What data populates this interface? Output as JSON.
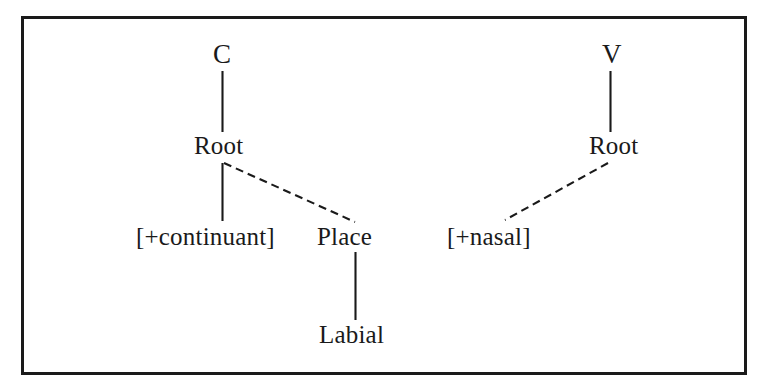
{
  "figure": {
    "type": "phonological-feature-geometry",
    "caption": "",
    "frame": {
      "border_color": "#1a1a1a",
      "border_width": 3,
      "background": "#ffffff"
    },
    "line_color": "#1a1a1a",
    "solid_line_label": "association line (solid)",
    "dashed_line_label": "association line (dashed)"
  },
  "trees": [
    {
      "id": "c-tree",
      "root_segment": "C",
      "nodes": [
        {
          "id": "c",
          "label": "C",
          "x": 222,
          "y": 58
        },
        {
          "id": "root-left",
          "label": "Root",
          "x": 223,
          "y": 147
        },
        {
          "id": "continuant",
          "label": "[+continuant]",
          "x": 215,
          "y": 238
        },
        {
          "id": "place",
          "label": "Place",
          "x": 353,
          "y": 238
        },
        {
          "id": "labial",
          "label": "Labial",
          "x": 355,
          "y": 336
        }
      ],
      "edges": [
        {
          "from": "c",
          "to": "root-left",
          "style": "solid"
        },
        {
          "from": "root-left",
          "to": "continuant",
          "style": "solid"
        },
        {
          "from": "root-left",
          "to": "place",
          "style": "dashed"
        },
        {
          "from": "place",
          "to": "labial",
          "style": "solid"
        }
      ]
    },
    {
      "id": "v-tree",
      "root_segment": "V",
      "nodes": [
        {
          "id": "v",
          "label": "V",
          "x": 610,
          "y": 58
        },
        {
          "id": "root-right",
          "label": "Root",
          "x": 618,
          "y": 147
        },
        {
          "id": "nasal",
          "label": "[+nasal]",
          "x": 500,
          "y": 238
        }
      ],
      "edges": [
        {
          "from": "v",
          "to": "root-right",
          "style": "solid"
        },
        {
          "from": "root-right",
          "to": "nasal",
          "style": "dashed"
        }
      ]
    }
  ],
  "labels": {
    "c": "C",
    "v": "V",
    "root_left": "Root",
    "root_right": "Root",
    "continuant": "[+continuant]",
    "place": "Place",
    "labial": "Labial",
    "nasal": "[+nasal]"
  }
}
